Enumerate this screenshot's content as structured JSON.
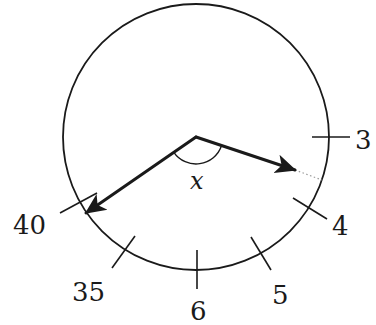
{
  "diagram": {
    "colors": {
      "stroke": "#1a1a1a",
      "background": "#ffffff",
      "dotted": "#9a9a9a"
    },
    "circle": {
      "cx": 196,
      "cy": 137,
      "r": 133
    },
    "angle_label": "x",
    "ticks": [
      {
        "label": "3",
        "x1": 312,
        "y1": 137,
        "x2": 350,
        "y2": 137,
        "tx": 355,
        "ty": 149
      },
      {
        "label": "4",
        "x1": 293,
        "y1": 198,
        "x2": 327,
        "y2": 219,
        "tx": 332,
        "ty": 235
      },
      {
        "label": "5",
        "x1": 251,
        "y1": 237,
        "x2": 271,
        "y2": 270,
        "tx": 272,
        "ty": 304
      },
      {
        "label": "6",
        "x1": 197,
        "y1": 250,
        "x2": 197,
        "y2": 289,
        "tx": 190,
        "ty": 320
      },
      {
        "label": "35",
        "x1": 112,
        "y1": 268,
        "x2": 135,
        "y2": 236,
        "tx": 72,
        "ty": 301
      },
      {
        "label": "40",
        "x1": 60,
        "y1": 213,
        "x2": 97,
        "y2": 193,
        "tx": 13,
        "ty": 234
      }
    ],
    "arrows": [
      {
        "name": "right-arrow",
        "x1": 196,
        "y1": 137,
        "x2": 295,
        "y2": 170
      },
      {
        "name": "left-arrow",
        "x1": 196,
        "y1": 137,
        "x2": 86,
        "y2": 213
      }
    ],
    "dotted_extension": {
      "x1": 295,
      "y1": 170,
      "x2": 322,
      "y2": 180
    }
  }
}
